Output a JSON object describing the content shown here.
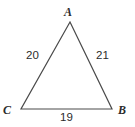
{
  "figure": {
    "kind": "triangle-diagram",
    "background_color": "#ffffff",
    "stroke_color": "#4a4a4a",
    "text_color": "#2b2b2b",
    "vertices": [
      {
        "name": "A",
        "label": "A",
        "x": 70,
        "y": 22
      },
      {
        "name": "B",
        "label": "B",
        "x": 112,
        "y": 109
      },
      {
        "name": "C",
        "label": "C",
        "x": 21,
        "y": 109
      }
    ],
    "sides": [
      {
        "name": "CA",
        "label": "20",
        "from": "C",
        "to": "A"
      },
      {
        "name": "AB",
        "label": "21",
        "from": "A",
        "to": "B"
      },
      {
        "name": "CB",
        "label": "19",
        "from": "C",
        "to": "B"
      }
    ]
  },
  "chart_data": {
    "type": "diagram",
    "title": "",
    "shape": "triangle",
    "vertex_labels": [
      "A",
      "B",
      "C"
    ],
    "side_labels": {
      "CA": "20",
      "AB": "21",
      "CB": "19"
    },
    "side_lengths": [
      20,
      21,
      19
    ],
    "points": {
      "A": [
        70,
        22
      ],
      "B": [
        112,
        109
      ],
      "C": [
        21,
        109
      ]
    }
  }
}
